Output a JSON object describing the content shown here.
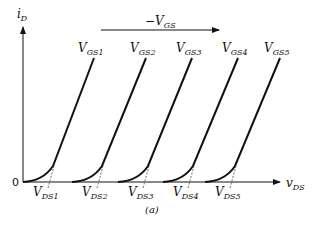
{
  "diagram": {
    "type": "MOSFET output characteristics (i_D vs v_DS) for decreasing -V_GS",
    "caption": "(a)",
    "axes": {
      "y_label": {
        "main": "i",
        "sub": "D"
      },
      "x_label": {
        "main": "v",
        "sub": "DS"
      },
      "origin_label": "0"
    },
    "direction_arrow": {
      "label_prefix": "−V",
      "label_sub": "GS"
    },
    "curves": [
      {
        "gs_main": "V",
        "gs_sub": "GS1",
        "ds_main": "V",
        "ds_sub": "DS1",
        "x0": 23,
        "knee": 47,
        "top_x": 94,
        "label_x": 82
      },
      {
        "gs_main": "V",
        "gs_sub": "GS2",
        "ds_main": "V",
        "ds_sub": "DS2",
        "x0": 72,
        "knee": 96,
        "top_x": 146,
        "label_x": 134
      },
      {
        "gs_main": "V",
        "gs_sub": "GS3",
        "ds_main": "V",
        "ds_sub": "DS3",
        "x0": 118,
        "knee": 142,
        "top_x": 192,
        "label_x": 180
      },
      {
        "gs_main": "V",
        "gs_sub": "GS4",
        "ds_main": "V",
        "ds_sub": "DS4",
        "x0": 163,
        "knee": 187,
        "top_x": 238,
        "label_x": 226
      },
      {
        "gs_main": "V",
        "gs_sub": "GS5",
        "ds_main": "V",
        "ds_sub": "DS5",
        "x0": 205,
        "knee": 229,
        "top_x": 280,
        "label_x": 268
      }
    ]
  }
}
